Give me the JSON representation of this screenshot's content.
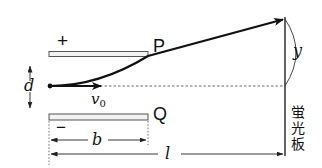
{
  "diagram": {
    "plates": {
      "top": {
        "label": "P",
        "charge_sign": "+"
      },
      "bottom": {
        "label": "Q",
        "charge_sign": "−"
      }
    },
    "labels": {
      "gap": "d",
      "initial_velocity": "v",
      "initial_velocity_sub": "0",
      "plate_length": "b",
      "distance_to_screen": "l",
      "deflection": "y"
    },
    "screen": {
      "label_chars": [
        "蛍",
        "光",
        "板"
      ]
    },
    "colors": {
      "stroke": "#111111",
      "plate_fill": "#f2f2f2",
      "plate_stroke": "#555555",
      "dashed": "#444444"
    }
  }
}
